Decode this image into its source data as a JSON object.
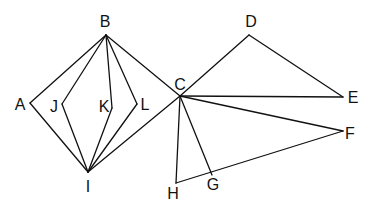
{
  "diagram": {
    "type": "geometric-figure",
    "points": {
      "A": {
        "x": 30,
        "y": 103,
        "lx": 20,
        "ly": 104
      },
      "B": {
        "x": 106,
        "y": 35,
        "lx": 105,
        "ly": 21
      },
      "C": {
        "x": 180,
        "y": 96,
        "lx": 180,
        "ly": 84
      },
      "D": {
        "x": 249,
        "y": 35,
        "lx": 251,
        "ly": 21
      },
      "E": {
        "x": 343,
        "y": 97,
        "lx": 353,
        "ly": 97
      },
      "F": {
        "x": 343,
        "y": 131,
        "lx": 350,
        "ly": 133
      },
      "G": {
        "x": 212,
        "y": 175,
        "lx": 213,
        "ly": 184
      },
      "H": {
        "x": 176,
        "y": 183,
        "lx": 173,
        "ly": 193
      },
      "I": {
        "x": 88,
        "y": 172,
        "lx": 88,
        "ly": 186
      },
      "J": {
        "x": 62,
        "y": 104,
        "lx": 54,
        "ly": 106
      },
      "K": {
        "x": 112,
        "y": 108,
        "lx": 104,
        "ly": 106
      },
      "L": {
        "x": 137,
        "y": 104,
        "lx": 145,
        "ly": 104
      }
    },
    "segments": [
      [
        "B",
        "A"
      ],
      [
        "B",
        "J"
      ],
      [
        "B",
        "K"
      ],
      [
        "B",
        "L"
      ],
      [
        "B",
        "C"
      ],
      [
        "I",
        "A"
      ],
      [
        "I",
        "J"
      ],
      [
        "I",
        "K"
      ],
      [
        "I",
        "L"
      ],
      [
        "I",
        "C"
      ],
      [
        "C",
        "D"
      ],
      [
        "D",
        "E"
      ],
      [
        "C",
        "E"
      ],
      [
        "C",
        "F"
      ],
      [
        "C",
        "G"
      ],
      [
        "C",
        "H"
      ],
      [
        "H",
        "F"
      ]
    ],
    "labels": [
      "A",
      "B",
      "C",
      "D",
      "E",
      "F",
      "G",
      "H",
      "I",
      "J",
      "K",
      "L"
    ]
  }
}
